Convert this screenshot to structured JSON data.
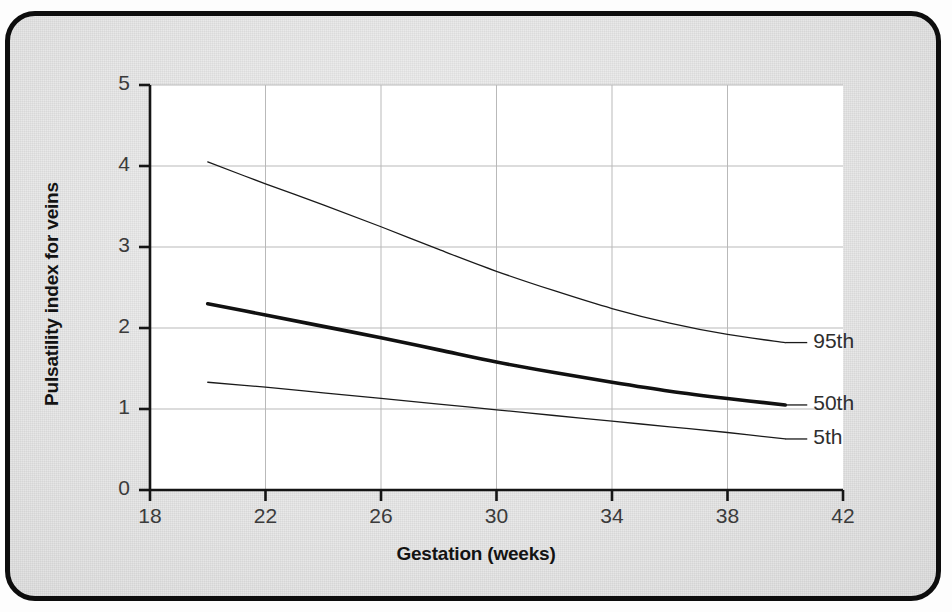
{
  "figure": {
    "background_color": "#e9e9e9",
    "plot_background_color": "#ffffff",
    "frame_color": "#0d0d0d"
  },
  "chart_data": {
    "type": "line",
    "title": "",
    "xlabel": "Gestation (weeks)",
    "ylabel": "Pulsatility index for veins",
    "xlim": [
      18,
      42
    ],
    "ylim": [
      0,
      5
    ],
    "xticks": [
      18,
      22,
      26,
      30,
      34,
      38,
      42
    ],
    "yticks": [
      0,
      1,
      2,
      3,
      4,
      5
    ],
    "grid": true,
    "legend_position": "right-inline-labels",
    "x": [
      20,
      22,
      24,
      26,
      28,
      30,
      32,
      34,
      36,
      38,
      40
    ],
    "series": [
      {
        "name": "95th",
        "label": "95th",
        "line_width": 1.3,
        "color": "#1a1a1a",
        "values": [
          4.05,
          3.78,
          3.52,
          3.25,
          2.97,
          2.7,
          2.46,
          2.24,
          2.06,
          1.92,
          1.82
        ]
      },
      {
        "name": "50th",
        "label": "50th",
        "line_width": 3.6,
        "color": "#111111",
        "values": [
          2.3,
          2.16,
          2.02,
          1.88,
          1.73,
          1.58,
          1.45,
          1.33,
          1.22,
          1.13,
          1.05
        ]
      },
      {
        "name": "5th",
        "label": "5th",
        "line_width": 1.3,
        "color": "#1a1a1a",
        "values": [
          1.33,
          1.27,
          1.2,
          1.13,
          1.06,
          0.99,
          0.92,
          0.85,
          0.78,
          0.71,
          0.63
        ]
      }
    ],
    "series_label_anchors": [
      {
        "name": "95th",
        "x": 40,
        "y": 1.82
      },
      {
        "name": "50th",
        "x": 40,
        "y": 1.05
      },
      {
        "name": "5th",
        "x": 40,
        "y": 0.63
      }
    ],
    "xtick_labels": [
      "18",
      "22",
      "26",
      "30",
      "34",
      "38",
      "42"
    ],
    "ytick_labels": [
      "0",
      "1",
      "2",
      "3",
      "4",
      "5"
    ]
  }
}
